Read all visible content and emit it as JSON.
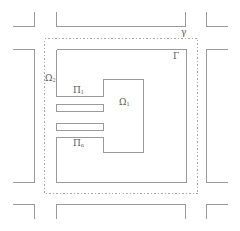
{
  "figure": {
    "colors": {
      "line": "#9a9a9a",
      "dashed": "#a8a8a8",
      "label": "#5a5a5a"
    },
    "labels": {
      "gamma_lower": {
        "base": "γ",
        "sub": ""
      },
      "gamma_upper": {
        "base": "Γ",
        "sub": ""
      },
      "omega2": {
        "base": "Ω",
        "sub": "2"
      },
      "omega1": {
        "base": "Ω",
        "sub": "1"
      },
      "pi1": {
        "base": "Π",
        "sub": "1"
      },
      "pin": {
        "base": "Π",
        "sub": "n"
      }
    }
  }
}
